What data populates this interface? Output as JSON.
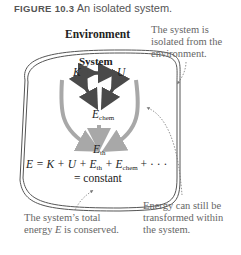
{
  "figure": {
    "label": "FIGURE 10.3",
    "title": "An isolated system."
  },
  "diagram": {
    "environment_label": "Environment",
    "system_label": "System",
    "nodes": {
      "K": "K",
      "U": "U",
      "E_chem": "E",
      "E_chem_sub": "chem",
      "E_th": "E",
      "E_th_sub": "th"
    },
    "equation": {
      "lhs": "E = K + U + E",
      "th_sub": "th",
      "mid": " + E",
      "chem_sub": "chem",
      "tail": " + · · ·",
      "line2": "= constant"
    },
    "annotations": {
      "isolated": [
        "The system is",
        "isolated from the",
        "environment."
      ],
      "conserved": [
        "The system’s total",
        "energy E is conserved."
      ],
      "transformed": [
        "Energy can still be",
        "transformed within",
        "the system."
      ]
    },
    "colors": {
      "boundary": "#555555",
      "dark_arrow": "#4a4a4a",
      "light_arrow": "#a8a8a8",
      "note_text": "#666666"
    }
  }
}
